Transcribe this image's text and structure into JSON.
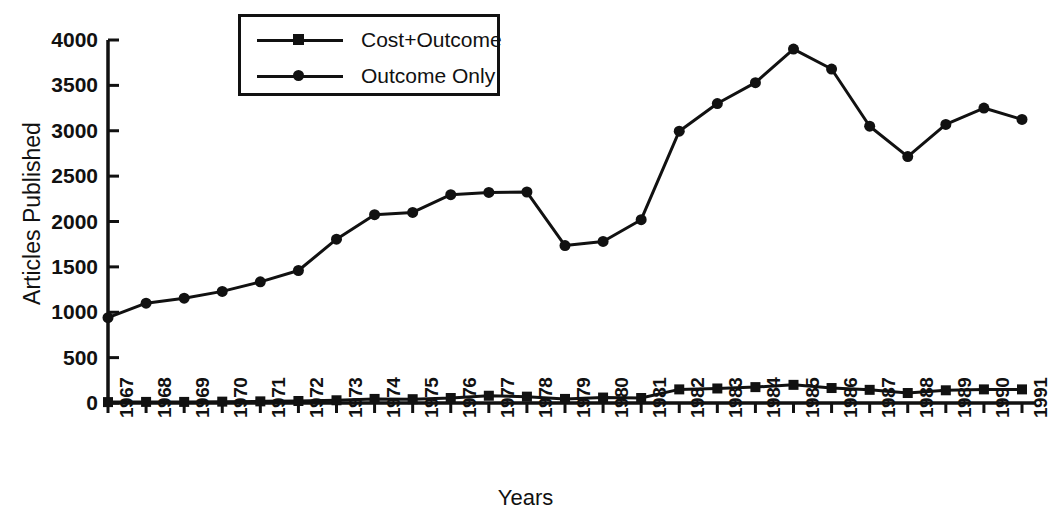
{
  "chart_data": {
    "type": "line",
    "title": "",
    "xlabel": "Years",
    "ylabel": "Articles Published",
    "ylim": [
      0,
      4000
    ],
    "yticks": [
      0,
      500,
      1000,
      1500,
      2000,
      2500,
      3000,
      3500,
      4000
    ],
    "ytick_labels": [
      "0",
      "500",
      "1000",
      "1500",
      "2000",
      "2500",
      "3000",
      "3500",
      "4000"
    ],
    "grid": false,
    "legend_position": "top-left-inside",
    "x": [
      1967,
      1968,
      1969,
      1970,
      1971,
      1972,
      1973,
      1974,
      1975,
      1976,
      1977,
      1978,
      1979,
      1980,
      1981,
      1982,
      1983,
      1984,
      1985,
      1986,
      1987,
      1988,
      1989,
      1990,
      1991
    ],
    "categories": [
      "1967",
      "1968",
      "1969",
      "1970",
      "1971",
      "1972",
      "1973",
      "1974",
      "1975",
      "1976",
      "1977",
      "1978",
      "1979",
      "1980",
      "1981",
      "1982",
      "1983",
      "1984",
      "1985",
      "1986",
      "1987",
      "1988",
      "1989",
      "1990",
      "1991"
    ],
    "series": [
      {
        "name": "Cost+Outcome",
        "marker": "square",
        "values": [
          10,
          12,
          12,
          15,
          18,
          22,
          30,
          45,
          42,
          55,
          80,
          70,
          45,
          60,
          55,
          150,
          160,
          175,
          200,
          165,
          145,
          110,
          140,
          150,
          150
        ]
      },
      {
        "name": "Outcome Only",
        "marker": "circle",
        "values": [
          940,
          1100,
          1155,
          1230,
          1335,
          1460,
          1805,
          2075,
          2100,
          2295,
          2320,
          2325,
          1735,
          1780,
          2020,
          2995,
          3300,
          3530,
          3900,
          3680,
          3050,
          2715,
          3070,
          3250,
          3125
        ]
      }
    ]
  },
  "legend": {
    "items": [
      {
        "label": "Cost+Outcome",
        "marker": "square"
      },
      {
        "label": "Outcome Only",
        "marker": "circle"
      }
    ]
  },
  "axes": {
    "y_title": "Articles Published",
    "x_title": "Years"
  },
  "colors": {
    "ink": "#111111",
    "background": "#ffffff"
  }
}
